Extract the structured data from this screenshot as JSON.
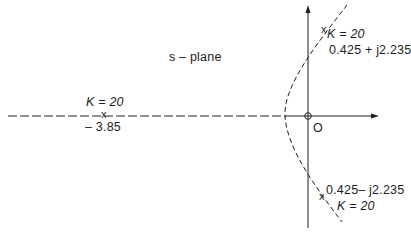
{
  "diagram": {
    "type": "root-locus",
    "plane_label": "s – plane",
    "origin_label": "O",
    "colors": {
      "ink": "#1e1e1e",
      "background": "#ffffff"
    },
    "real_pole": {
      "gain_label": "K = 20",
      "value_label": "– 3.85"
    },
    "upper_pole": {
      "gain_label": "K = 20",
      "value_label": "0.425 + j2.235"
    },
    "lower_pole": {
      "gain_label": "K = 20",
      "value_label": "0.425– j2.235"
    },
    "markers": {
      "pole": "x",
      "zero": "o"
    }
  }
}
